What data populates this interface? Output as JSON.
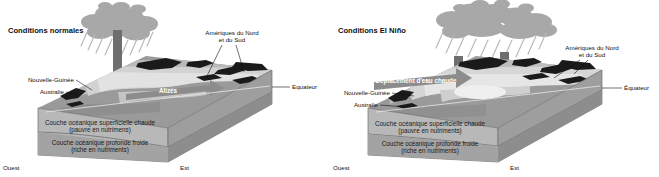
{
  "figure": {
    "colors": {
      "cloud": "#a8a8a8",
      "rain": "#b5b5b5",
      "arrow_convection": "#6e6e6e",
      "arrow_wind": "#8c8c8c",
      "ocean_surface": "#9a9a9a",
      "ocean_light": "#d2d2d2",
      "land": "#1a1a1a",
      "block_warm_layer": "#c9c9c9",
      "block_cold_layer": "#9e9e9e",
      "block_front": "#b8b8b8",
      "text": "#111111",
      "background": "#ffffff"
    }
  },
  "panels": [
    {
      "id": "normal",
      "title": "Conditions normales",
      "labels": {
        "new_guinea": "Nouvelle-Guinée",
        "australia": "Australie",
        "americas_line1": "Amériques du Nord",
        "americas_line2": "et du Sud",
        "equator": "Equateur",
        "wind_arrow": "Alizés",
        "warm_layer_line1": "Couche océanique superficielle chaude",
        "warm_layer_line2": "(pauvre en nutrimens)",
        "cold_layer_line1": "Couche océanique profonde froide",
        "cold_layer_line2": "(riche en nutriments)",
        "west": "Ouest",
        "east": "Est"
      },
      "convection_arrows": 1,
      "wind_arrow_direction": "west",
      "thermocline": "tilted deep in the west, shallow in the east"
    },
    {
      "id": "elnino",
      "title": "Conditions El Niño",
      "labels": {
        "new_guinea": "Nouvelle-Guinée",
        "australia": "Australie",
        "americas_line1": "Amériques du Nord",
        "americas_line2": "et du Sud",
        "equator": "Équateur",
        "warm_water_arrow": "Déplacement d'eau chaude",
        "warm_layer_line1": "Couche océanique superficielle chaude",
        "warm_layer_line2": "(pauvre en nutriments)",
        "cold_layer_line1": "Couche océanique profonde froide",
        "cold_layer_line2": "(riche en nutriments)",
        "west": "Ouest",
        "east": "Est"
      },
      "convection_arrows": 2,
      "wind_arrow_direction": "west",
      "thermocline": "nearly flat / level"
    }
  ]
}
